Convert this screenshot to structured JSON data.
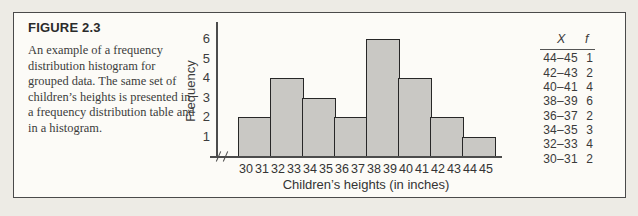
{
  "figure": {
    "label": "FIGURE 2.3",
    "caption": "An example of a frequency distribution histogram for grouped data. The same set of children’s heights is presented in a frequency distribution table and in a histogram."
  },
  "chart_data": {
    "type": "bar",
    "title": "",
    "categories": [
      "30–31",
      "32–33",
      "34–35",
      "36–37",
      "38–39",
      "40–41",
      "42–43",
      "44–45"
    ],
    "values": [
      2,
      4,
      3,
      2,
      6,
      4,
      2,
      1
    ],
    "xlabel": "Children’s heights (in inches)",
    "ylabel": "Frequency",
    "x_tick_labels": [
      "30",
      "31",
      "32",
      "33",
      "34",
      "35",
      "36",
      "37",
      "38",
      "39",
      "40",
      "41",
      "42",
      "43",
      "44",
      "45"
    ],
    "y_ticks": [
      1,
      2,
      3,
      4,
      5,
      6
    ],
    "ylim": [
      0,
      6
    ],
    "legend": null,
    "grid": false,
    "bar_fill": "#c9c8c4",
    "bar_border": "#272727",
    "axis_break_before_first_bin": true
  },
  "table": {
    "headers": [
      "X",
      "f"
    ],
    "rows": [
      {
        "x": "44–45",
        "f": "1"
      },
      {
        "x": "42–43",
        "f": "2"
      },
      {
        "x": "40–41",
        "f": "4"
      },
      {
        "x": "38–39",
        "f": "6"
      },
      {
        "x": "36–37",
        "f": "2"
      },
      {
        "x": "34–35",
        "f": "3"
      },
      {
        "x": "32–33",
        "f": "4"
      },
      {
        "x": "30–31",
        "f": "2"
      }
    ]
  }
}
